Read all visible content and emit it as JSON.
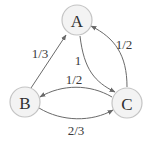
{
  "diagram": {
    "type": "markov-chain",
    "colors": {
      "node_fill": "#f3f3f3",
      "node_stroke": "#c4c4c4",
      "edge": "#6a6a6a",
      "text": "#2f2f2f"
    },
    "nodes": [
      {
        "id": "A",
        "label": "A"
      },
      {
        "id": "B",
        "label": "B"
      },
      {
        "id": "C",
        "label": "C"
      }
    ],
    "edges": [
      {
        "from": "B",
        "to": "A",
        "label": "1/3"
      },
      {
        "from": "A",
        "to": "C",
        "label": "1"
      },
      {
        "from": "C",
        "to": "A",
        "label": "1/2"
      },
      {
        "from": "C",
        "to": "B",
        "label": "1/2"
      },
      {
        "from": "B",
        "to": "C",
        "label": "2/3"
      }
    ]
  }
}
